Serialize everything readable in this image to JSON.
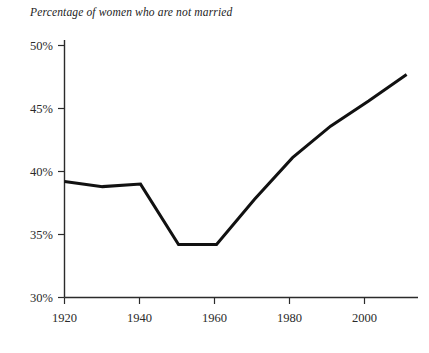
{
  "chart_data": {
    "type": "line",
    "title": "Percentage of women who are not married",
    "xlabel": "",
    "ylabel": "",
    "x": [
      1920,
      1930,
      1940,
      1950,
      1960,
      1970,
      1980,
      1990,
      2000,
      2010
    ],
    "values": [
      39.2,
      38.8,
      39.0,
      34.2,
      34.2,
      37.8,
      41.1,
      43.6,
      45.6,
      47.7
    ],
    "series": [
      {
        "name": "Percentage of women who are not married",
        "values": [
          39.2,
          38.8,
          39.0,
          34.2,
          34.2,
          37.8,
          41.1,
          43.6,
          45.6,
          47.7
        ]
      }
    ],
    "xlim": [
      1920,
      2013
    ],
    "ylim": [
      30,
      50
    ],
    "x_ticks": [
      1920,
      1940,
      1960,
      1980,
      2000
    ],
    "x_tick_labels": [
      "1920",
      "1940",
      "1960",
      "1980",
      "2000"
    ],
    "y_ticks": [
      30,
      35,
      40,
      45,
      50
    ],
    "y_tick_labels": [
      "30%",
      "35%",
      "40%",
      "45%",
      "50%"
    ],
    "grid": false,
    "legend": false,
    "legend_position": "none",
    "line_color": "#111111",
    "line_width": 3,
    "axis_color": "#2b2b2b",
    "background_color": "#ffffff"
  }
}
